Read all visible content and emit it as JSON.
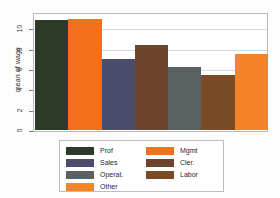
{
  "chart_data": {
    "type": "bar",
    "title": "",
    "xlabel": "",
    "ylabel": "mean of wage",
    "ylim": [
      0,
      11.5
    ],
    "grid": true,
    "legend_position": "bottom-center",
    "yticks": [
      "10",
      "8",
      "6",
      "4",
      "2",
      "0"
    ],
    "ytick_values": [
      10,
      8,
      6,
      4,
      2,
      0
    ],
    "categories": [
      "Prof",
      "Mgmt",
      "Sales",
      "Cler.",
      "Operat.",
      "Labor",
      "Other"
    ],
    "values": [
      10.8,
      10.9,
      7.0,
      8.4,
      6.2,
      5.4,
      7.5
    ],
    "colors": [
      "#2c3b28",
      "#f4701f",
      "#4b4b6b",
      "#6d452f",
      "#5a6163",
      "#7b4a26",
      "#f4842a"
    ]
  },
  "legend": {
    "left_column": [
      {
        "label": "Prof",
        "color": "#2c3b28"
      },
      {
        "label": "Sales",
        "color": "#4b4b6b"
      },
      {
        "label": "Operat.",
        "color": "#5a6163"
      },
      {
        "label": "Other",
        "color": "#f4842a"
      }
    ],
    "right_column": [
      {
        "label": "Mgmt",
        "color": "#f4701f"
      },
      {
        "label": "Cler.",
        "color": "#6d452f"
      },
      {
        "label": "Labor",
        "color": "#7b4a26"
      }
    ]
  }
}
